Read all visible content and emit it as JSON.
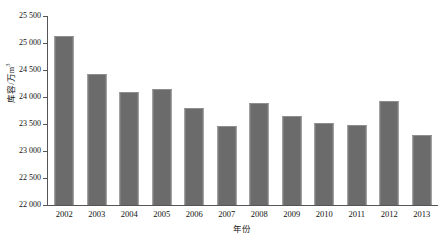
{
  "chart_data": {
    "type": "bar",
    "title": "",
    "xlabel": "年份",
    "ylabel": "库容/万m³",
    "ylabel_base": "库容/万m",
    "ylabel_exp": "3",
    "categories": [
      "2002",
      "2003",
      "2004",
      "2005",
      "2006",
      "2007",
      "2008",
      "2009",
      "2010",
      "2011",
      "2012",
      "2013"
    ],
    "values": [
      25130,
      24430,
      24090,
      24150,
      23800,
      23460,
      23880,
      23650,
      23510,
      23490,
      23920,
      23290
    ],
    "series": [
      {
        "name": "库容",
        "values": [
          25130,
          24430,
          24090,
          24150,
          23800,
          23460,
          23880,
          23650,
          23510,
          23490,
          23920,
          23290
        ]
      }
    ],
    "ylim": [
      22000,
      25500
    ],
    "yticks": [
      22000,
      22500,
      23000,
      23500,
      24000,
      24500,
      25000,
      25500
    ],
    "ytick_labels": [
      "22 000",
      "22 500",
      "23 000",
      "23 500",
      "24 000",
      "24 500",
      "25 000",
      "25 500"
    ],
    "grid": false,
    "legend": false,
    "bar_color": "#6b6b6b",
    "bar_edge_color": "#8e8e8e",
    "axis_color": "#555555",
    "background": "#ffffff"
  }
}
